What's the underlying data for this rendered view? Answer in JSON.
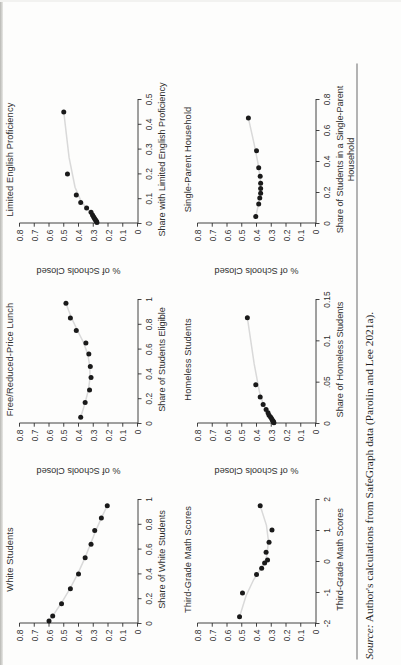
{
  "figure": {
    "shared": {
      "ylabel": "% of Schools Closed",
      "yticks": [
        "0",
        "0.1",
        "0.2",
        "0.3",
        "0.4",
        "0.5",
        "0.6",
        "0.7",
        "0.8"
      ],
      "ylim": [
        0,
        0.8
      ],
      "marker_color": "#1a1a1a",
      "fit_line_color": "#d9d9d9",
      "axis_color": "#2e2e2e"
    },
    "source": {
      "prefix": "Source:",
      "text": " Author's calculations from SafeGraph data (Parolin and Lee 2021a)."
    }
  },
  "chart_data": [
    {
      "id": "white-students",
      "type": "scatter",
      "title": "White Students",
      "xlabel": "Share of White Students",
      "ylabel": "% of Schools Closed",
      "xlim": [
        0,
        1
      ],
      "ylim": [
        0,
        0.8
      ],
      "xticks": [
        "0",
        "0.2",
        "0.4",
        "0.6",
        "0.8",
        "1"
      ],
      "xtickvals": [
        0,
        0.2,
        0.4,
        0.6,
        0.8,
        1
      ],
      "yticks": [
        "0",
        "0.1",
        "0.2",
        "0.3",
        "0.4",
        "0.5",
        "0.6",
        "0.7",
        "0.8"
      ],
      "grid": false,
      "legend": "none",
      "x": [
        0.02,
        0.06,
        0.16,
        0.28,
        0.4,
        0.53,
        0.64,
        0.75,
        0.85,
        0.95
      ],
      "y": [
        0.6,
        0.575,
        0.515,
        0.455,
        0.4,
        0.355,
        0.315,
        0.29,
        0.245,
        0.205
      ],
      "fit": "decreasing-linear"
    },
    {
      "id": "free-reduced-price-lunch",
      "type": "scatter",
      "title": "Free/Reduced-Price Lunch",
      "xlabel": "Share of Students Eligible",
      "ylabel": "% of Schools Closed",
      "xlim": [
        0,
        1
      ],
      "ylim": [
        0,
        0.8
      ],
      "xticks": [
        "0",
        "0.2",
        "0.4",
        "0.6",
        "0.8",
        "1"
      ],
      "xtickvals": [
        0,
        0.2,
        0.4,
        0.6,
        0.8,
        1
      ],
      "yticks": [
        "0",
        "0.1",
        "0.2",
        "0.3",
        "0.4",
        "0.5",
        "0.6",
        "0.7",
        "0.8"
      ],
      "grid": false,
      "legend": "none",
      "x": [
        0.05,
        0.17,
        0.27,
        0.37,
        0.46,
        0.56,
        0.65,
        0.75,
        0.85,
        0.97
      ],
      "y": [
        0.385,
        0.355,
        0.325,
        0.315,
        0.32,
        0.33,
        0.35,
        0.415,
        0.455,
        0.485
      ],
      "fit": "u-shaped"
    },
    {
      "id": "limited-english-proficiency",
      "type": "scatter",
      "title": "Limited English Proficiency",
      "xlabel": "Share with Limited English Proficiency",
      "ylabel": "% of Schools Closed",
      "xlim": [
        0,
        0.5
      ],
      "ylim": [
        0,
        0.8
      ],
      "xticks": [
        "0",
        "0.1",
        "0.2",
        "0.3",
        "0.4",
        "0.5"
      ],
      "xtickvals": [
        0,
        0.1,
        0.2,
        0.3,
        0.4,
        0.5
      ],
      "yticks": [
        "0",
        "0.1",
        "0.2",
        "0.3",
        "0.4",
        "0.5",
        "0.6",
        "0.7",
        "0.8"
      ],
      "grid": false,
      "legend": "none",
      "x": [
        0.004,
        0.008,
        0.012,
        0.016,
        0.021,
        0.027,
        0.034,
        0.045,
        0.062,
        0.085,
        0.115,
        0.2,
        0.45
      ],
      "y": [
        0.275,
        0.278,
        0.282,
        0.287,
        0.292,
        0.298,
        0.305,
        0.315,
        0.345,
        0.385,
        0.415,
        0.475,
        0.5
      ],
      "fit": "increasing-concave"
    },
    {
      "id": "third-grade-math-scores",
      "type": "scatter",
      "title": "Third-Grade Math Scores",
      "xlabel": "Third-Grade Math Scores",
      "ylabel": "% of Schools Closed",
      "xlim": [
        -2,
        2
      ],
      "ylim": [
        0,
        0.8
      ],
      "xticks": [
        "-2",
        "-1",
        "0",
        "1",
        "2"
      ],
      "xtickvals": [
        -2,
        -1,
        0,
        1,
        2
      ],
      "yticks": [
        "0",
        "0.1",
        "0.2",
        "0.3",
        "0.4",
        "0.5",
        "0.6",
        "0.7",
        "0.8"
      ],
      "grid": false,
      "legend": "none",
      "x": [
        -1.78,
        -1.02,
        -0.42,
        -0.22,
        -0.05,
        0.05,
        0.3,
        0.62,
        1.02,
        1.8
      ],
      "y": [
        0.515,
        0.495,
        0.4,
        0.365,
        0.345,
        0.325,
        0.335,
        0.315,
        0.295,
        0.375
      ],
      "fit": "decreasing-then-flat"
    },
    {
      "id": "homeless-students",
      "type": "scatter",
      "title": "Homeless Students",
      "xlabel": "Share of Homeless Students",
      "ylabel": "% of Schools Closed",
      "xlim": [
        0,
        0.15
      ],
      "ylim": [
        0,
        0.8
      ],
      "xticks": [
        "0",
        ".05",
        "0.1",
        "0.15"
      ],
      "xtickvals": [
        0,
        0.05,
        0.1,
        0.15
      ],
      "yticks": [
        "0",
        "0.1",
        "0.2",
        "0.3",
        "0.4",
        "0.5",
        "0.6",
        "0.7",
        "0.8"
      ],
      "grid": false,
      "legend": "none",
      "x": [
        0.001,
        0.002,
        0.003,
        0.004,
        0.006,
        0.008,
        0.01,
        0.013,
        0.017,
        0.023,
        0.032,
        0.047,
        0.128
      ],
      "y": [
        0.282,
        0.285,
        0.288,
        0.292,
        0.298,
        0.305,
        0.315,
        0.322,
        0.335,
        0.355,
        0.375,
        0.405,
        0.462
      ],
      "fit": "increasing-concave"
    },
    {
      "id": "single-parent-household",
      "type": "scatter",
      "title": "Single-Parent Household",
      "xlabel": "Share of Students in a Single-Parent",
      "xlabel2": "Household",
      "ylabel": "% of Schools Closed",
      "xlim": [
        0,
        0.8
      ],
      "ylim": [
        0,
        0.8
      ],
      "xticks": [
        "0",
        "0.2",
        "0.4",
        "0.6",
        "0.8"
      ],
      "xtickvals": [
        0,
        0.2,
        0.4,
        0.6,
        0.8
      ],
      "yticks": [
        "0",
        "0.1",
        "0.2",
        "0.3",
        "0.4",
        "0.5",
        "0.6",
        "0.7",
        "0.8"
      ],
      "grid": false,
      "legend": "none",
      "x": [
        0.045,
        0.125,
        0.165,
        0.195,
        0.225,
        0.26,
        0.305,
        0.36,
        0.47,
        0.68
      ],
      "y": [
        0.405,
        0.385,
        0.378,
        0.372,
        0.372,
        0.372,
        0.375,
        0.385,
        0.4,
        0.455
      ],
      "fit": "flat-then-rising"
    }
  ]
}
